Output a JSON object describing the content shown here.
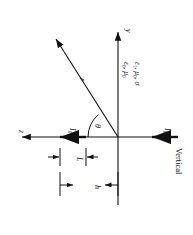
{
  "figure": {
    "orientation_note": "Vertical",
    "rotation_degrees": 90,
    "ink_color": "#111111",
    "background_color": "#ffffff"
  },
  "axes": {
    "vertical_axis_label": "y",
    "horizontal_axis_label": "z"
  },
  "media": {
    "upper": {
      "permittivity": "ε",
      "permittivity_sub": "0",
      "permeability": "μ",
      "permeability_sub": "0",
      "text": "ε0, μ0"
    },
    "lower": {
      "permittivity": "ε",
      "permittivity_sub": "1",
      "permeability": "μ",
      "permeability_sub": "0",
      "conductivity": "σ",
      "text": "ε1, μ0, σ"
    }
  },
  "sources": {
    "dipole_current_label": "I",
    "dipole_current_sub": "0",
    "image_current_label": "I",
    "image_current_sub": "0"
  },
  "coordinates": {
    "radial_label": "r",
    "angle_label": "θ"
  },
  "dimensions": {
    "length_label": "L",
    "height_label": "h"
  }
}
